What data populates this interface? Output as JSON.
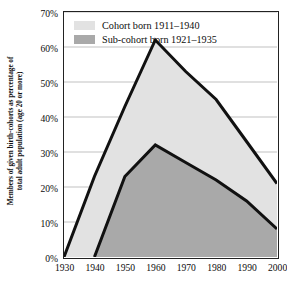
{
  "chart_data": {
    "type": "area",
    "title": "",
    "subtitle": "",
    "xlabel": "",
    "ylabel": "Members of given birth-cohorts as percentage of total adult population (age 20 or more)",
    "ylabel_line1": "Members of given birth-cohorts as percentage of",
    "ylabel_line2": "total adult population (age 20 or more)",
    "x": [
      1930,
      1940,
      1950,
      1960,
      1970,
      1980,
      1990,
      2000
    ],
    "categories": [
      "1930",
      "1940",
      "1950",
      "1960",
      "1970",
      "1980",
      "1990",
      "2000"
    ],
    "xlim": [
      1930,
      2000
    ],
    "ylim": [
      0,
      70
    ],
    "ytick_values": [
      0,
      10,
      20,
      30,
      40,
      50,
      60,
      70
    ],
    "ytick_labels": [
      "0%",
      "10%",
      "20%",
      "30%",
      "40%",
      "50%",
      "60%",
      "70%"
    ],
    "xtick_labels": [
      "1930",
      "1940",
      "1950",
      "1960",
      "1970",
      "1980",
      "1990",
      "2000"
    ],
    "grid": true,
    "grid_axis": "y",
    "legend_position": "top-left-inside",
    "series": [
      {
        "name": "Cohort born 1911–1940",
        "fill_color": "#e2e2e2",
        "line_color": "#111111",
        "x": [
          1930,
          1940,
          1950,
          1960,
          1970,
          1980,
          1990,
          2000
        ],
        "values": [
          0,
          23,
          43,
          62,
          53,
          45,
          33,
          21
        ]
      },
      {
        "name": "Sub-cohort born 1921–1935",
        "fill_color": "#a9a9a9",
        "line_color": "#111111",
        "x": [
          1940,
          1950,
          1960,
          1970,
          1980,
          1990,
          2000
        ],
        "values": [
          0,
          23,
          32,
          27,
          22,
          16,
          8
        ]
      }
    ]
  },
  "legend": {
    "items": [
      {
        "label": "Cohort born 1911–1940",
        "color": "#e2e2e2"
      },
      {
        "label": "Sub-cohort born 1921–1935",
        "color": "#a9a9a9"
      }
    ]
  },
  "colors": {
    "cohort_light": "#e2e2e2",
    "subcohort_dark": "#a9a9a9",
    "outline": "#111111",
    "frame": "#222222",
    "gridline": "#a6a6a6",
    "background": "#ffffff"
  }
}
